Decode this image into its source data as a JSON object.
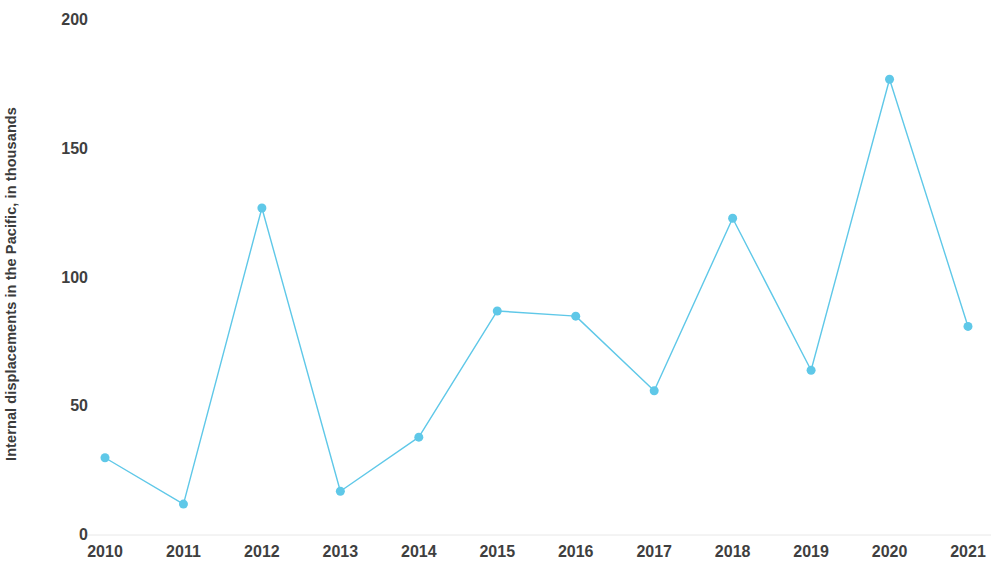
{
  "chart_data": {
    "type": "line",
    "title": "",
    "subtitle": "",
    "xlabel": "",
    "ylabel": "Internal displacements in the Pacific, in thousands",
    "categories": [
      "2010",
      "2011",
      "2012",
      "2013",
      "2014",
      "2015",
      "2016",
      "2017",
      "2018",
      "2019",
      "2020",
      "2021"
    ],
    "values": [
      30,
      12,
      127,
      17,
      38,
      87,
      85,
      56,
      123,
      64,
      177,
      81
    ],
    "x": [
      2010,
      2011,
      2012,
      2013,
      2014,
      2015,
      2016,
      2017,
      2018,
      2019,
      2020,
      2021
    ],
    "series": [
      {
        "name": "Internal displacements in the Pacific",
        "values": [
          30,
          12,
          127,
          17,
          38,
          87,
          85,
          56,
          123,
          64,
          177,
          81
        ]
      }
    ],
    "ylim": [
      0,
      200
    ],
    "yticks": [
      0,
      50,
      100,
      150,
      200
    ],
    "ytick_labels": [
      "0",
      "50",
      "100",
      "150",
      "200"
    ],
    "xtick_labels": [
      "2010",
      "2011",
      "2012",
      "2013",
      "2014",
      "2015",
      "2016",
      "2017",
      "2018",
      "2019",
      "2020",
      "2021"
    ],
    "grid": false,
    "legend": false,
    "legend_position": "none",
    "annotations": [],
    "colors": {
      "series": "#5fc8e8",
      "marker": "#5fc8e8",
      "axis_text": "#3f3f3f",
      "axis_title": "#3b3b3b",
      "background": "#ffffff",
      "axis_line": "#e8e8e8"
    },
    "marker": "circle",
    "marker_size": 9,
    "line_width": 1.4
  }
}
